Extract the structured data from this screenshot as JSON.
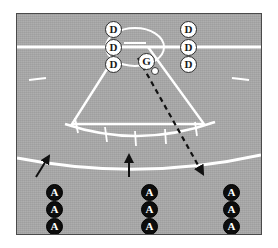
{
  "diagram": {
    "field": {
      "surface_color": "#a8a8a8",
      "line_color": "#ffffff",
      "border_color": "#4a4a4a"
    },
    "legend_colors": {
      "defense_token_fill": "#ffffff",
      "defense_token_stroke": "#2b2b2b",
      "attack_token_fill": "#0d0d0d",
      "attack_token_text": "#ffffff",
      "goalie_token_fill": "#ffffff",
      "ball_fill": "#ffffff",
      "pass_line_color": "#111111",
      "run_arrow_color": "#111111"
    },
    "markers": {
      "defense_label": "D",
      "goalie_label": "G",
      "attack_label": "A",
      "ball_label": "ball"
    },
    "defense_left": [
      {
        "label": "D",
        "x": 88,
        "y": 7
      },
      {
        "label": "D",
        "x": 88,
        "y": 25
      },
      {
        "label": "D",
        "x": 88,
        "y": 42
      }
    ],
    "defense_right": [
      {
        "label": "D",
        "x": 163,
        "y": 7
      },
      {
        "label": "D",
        "x": 163,
        "y": 25
      },
      {
        "label": "D",
        "x": 163,
        "y": 42
      }
    ],
    "goalie": {
      "label": "G",
      "x": 121,
      "y": 39
    },
    "ball": {
      "x": 134,
      "y": 53
    },
    "attack_columns": [
      {
        "name": "left-column",
        "arrow": "diagonal-up-right",
        "players": [
          {
            "label": "A",
            "x": 29,
            "y": 170
          },
          {
            "label": "A",
            "x": 29,
            "y": 187
          },
          {
            "label": "A",
            "x": 29,
            "y": 204
          }
        ]
      },
      {
        "name": "center-column",
        "arrow": "straight-up",
        "players": [
          {
            "label": "A",
            "x": 124,
            "y": 170
          },
          {
            "label": "A",
            "x": 124,
            "y": 187
          },
          {
            "label": "A",
            "x": 124,
            "y": 204
          }
        ]
      },
      {
        "name": "right-column",
        "arrow": "pass-received",
        "players": [
          {
            "label": "A",
            "x": 206,
            "y": 170
          },
          {
            "label": "A",
            "x": 206,
            "y": 187
          },
          {
            "label": "A",
            "x": 206,
            "y": 204
          }
        ]
      }
    ],
    "pass_line": {
      "style": "dashed",
      "from": "ball",
      "to": "right-column-lead-attacker"
    },
    "movement_arrows": [
      {
        "name": "left-run-arrow",
        "style": "solid",
        "direction": "up-right"
      },
      {
        "name": "center-run-arrow",
        "style": "solid",
        "direction": "up"
      }
    ]
  }
}
